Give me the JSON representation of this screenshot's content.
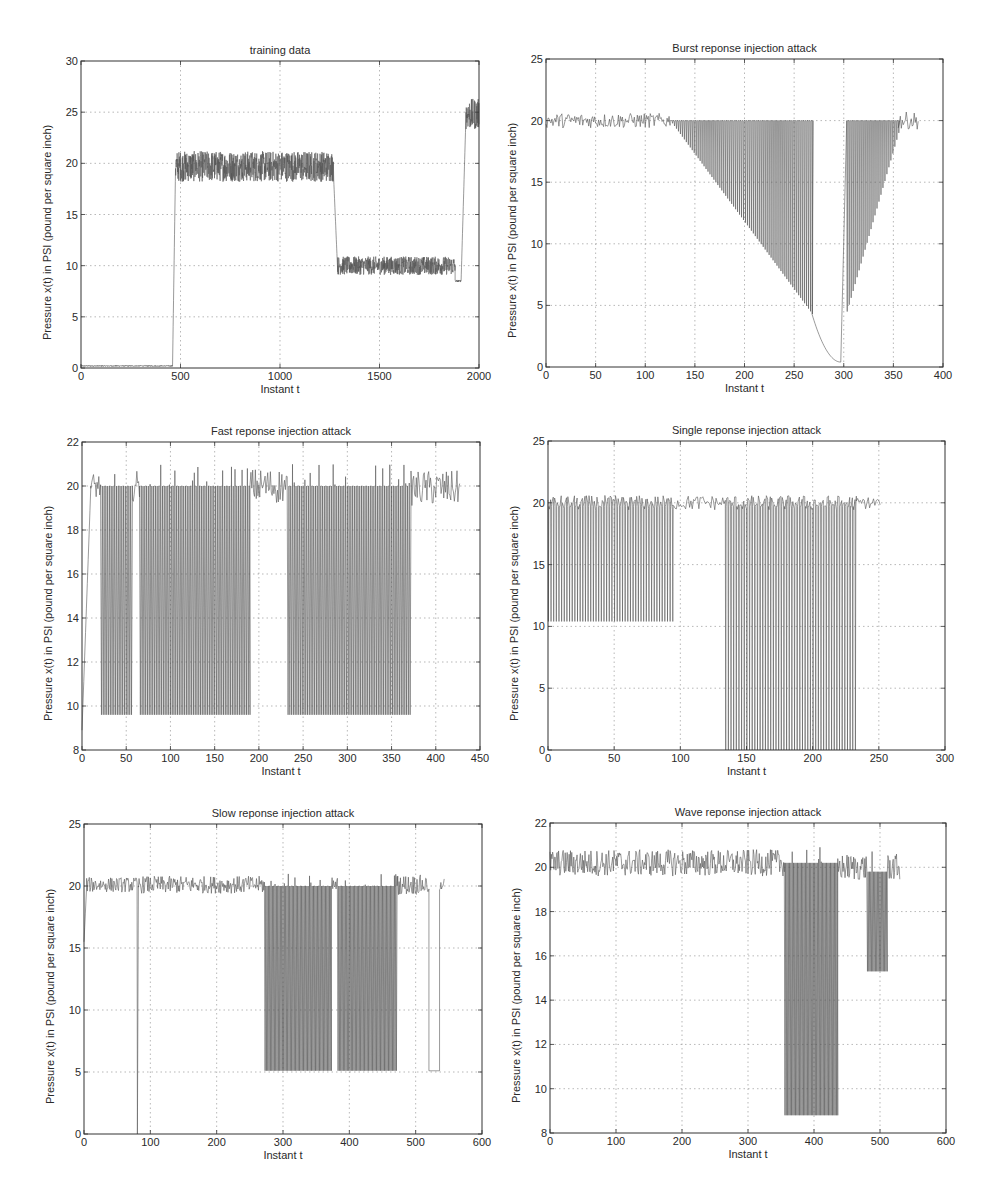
{
  "chart_data": [
    {
      "id": "p1",
      "type": "line",
      "title": "training data",
      "xlabel": "Instant t",
      "ylabel": "Pressure x(t) in PSI (pound per square inch)",
      "xlim": [
        0,
        2000
      ],
      "ylim": [
        0,
        30
      ],
      "xticks": [
        0,
        500,
        1000,
        1500,
        2000
      ],
      "yticks": [
        0,
        5,
        10,
        15,
        20,
        25,
        30
      ],
      "grid": true,
      "segments": [
        {
          "x": [
            0,
            460
          ],
          "level": 0.2,
          "noise": 0.05
        },
        {
          "x": [
            460,
            475
          ],
          "ramp_to": 19.5
        },
        {
          "x": [
            475,
            1270
          ],
          "level": 19.7,
          "noise": 1.5
        },
        {
          "x": [
            1270,
            1290
          ],
          "ramp_to": 9.4
        },
        {
          "x": [
            1290,
            1880
          ],
          "level": 10.0,
          "noise": 0.9
        },
        {
          "x": [
            1880,
            1910
          ],
          "level": 8.5,
          "noise": 0.1
        },
        {
          "x": [
            1910,
            1935
          ],
          "ramp_to": 25
        },
        {
          "x": [
            1935,
            2000
          ],
          "level": 24.8,
          "noise": 1.5
        }
      ]
    },
    {
      "id": "p2",
      "type": "line",
      "title": "Burst reponse injection attack",
      "xlabel": "Instant t",
      "ylabel": "Pressure x(t) in PSI (pound per square inch)",
      "xlim": [
        0,
        400
      ],
      "ylim": [
        0,
        25
      ],
      "xticks": [
        0,
        50,
        100,
        150,
        200,
        250,
        300,
        350,
        400
      ],
      "yticks": [
        0,
        5,
        10,
        15,
        20,
        25
      ],
      "grid": true,
      "segments": [
        {
          "x": [
            0,
            125
          ],
          "level": 20,
          "noise": 0.6
        },
        {
          "x": [
            125,
            268
          ],
          "attack": "burst-down",
          "high": 20,
          "low_start": 20,
          "low_end": 4.3
        },
        {
          "x": [
            268,
            297
          ],
          "curve": "decay",
          "from": 4.3,
          "to": 0.4
        },
        {
          "x": [
            297,
            303
          ],
          "ramp_to": 20
        },
        {
          "x": [
            303,
            355
          ],
          "attack": "burst-up",
          "high": 20,
          "low_start": 4.5,
          "low_end": 19
        },
        {
          "x": [
            355,
            375
          ],
          "level": 20,
          "noise": 0.7
        }
      ]
    },
    {
      "id": "p3",
      "type": "line",
      "title": "Fast reponse injection attack",
      "xlabel": "Instant t",
      "ylabel": "Pressure x(t) in PSI (pound per square inch)",
      "xlim": [
        0,
        450
      ],
      "ylim": [
        8,
        22
      ],
      "xticks": [
        0,
        50,
        100,
        150,
        200,
        250,
        300,
        350,
        400,
        450
      ],
      "yticks": [
        8,
        10,
        12,
        14,
        16,
        18,
        20,
        22
      ],
      "grid": true,
      "segments": [
        {
          "x": [
            0,
            10
          ],
          "ramp_from": 8.9,
          "ramp_to": 20
        },
        {
          "x": [
            10,
            21
          ],
          "level": 20,
          "noise": 0.6
        },
        {
          "x": [
            21,
            57
          ],
          "attack": "square",
          "high": 20,
          "low": 9.6
        },
        {
          "x": [
            57,
            65
          ],
          "level": 20,
          "noise": 0.7
        },
        {
          "x": [
            65,
            190
          ],
          "attack": "square",
          "high": 20,
          "low": 9.6
        },
        {
          "x": [
            190,
            232
          ],
          "level": 20,
          "noise": 0.8
        },
        {
          "x": [
            232,
            372
          ],
          "attack": "square",
          "high": 20,
          "low": 9.6
        },
        {
          "x": [
            372,
            427
          ],
          "level": 19.9,
          "noise": 0.8
        }
      ]
    },
    {
      "id": "p4",
      "type": "line",
      "title": "Single reponse injection attack",
      "xlabel": "Instant t",
      "ylabel": "Pressure x(t) in PSI (pound per square inch)",
      "xlim": [
        0,
        300
      ],
      "ylim": [
        0,
        25
      ],
      "xticks": [
        0,
        50,
        100,
        150,
        200,
        250,
        300
      ],
      "yticks": [
        0,
        5,
        10,
        15,
        20,
        25
      ],
      "grid": true,
      "segments": [
        {
          "x": [
            0,
            94
          ],
          "attack": "single",
          "high": 20,
          "low": 10.4
        },
        {
          "x": [
            94,
            134
          ],
          "level": 20,
          "noise": 0.6
        },
        {
          "x": [
            134,
            233
          ],
          "attack": "single",
          "high": 20,
          "low": 0
        },
        {
          "x": [
            233,
            251
          ],
          "level": 20,
          "noise": 0.5
        }
      ]
    },
    {
      "id": "p5",
      "type": "line",
      "title": "Slow reponse injection attack",
      "xlabel": "Instant t",
      "ylabel": "Pressure x(t) in PSI (pound per square inch)",
      "xlim": [
        0,
        600
      ],
      "ylim": [
        0,
        25
      ],
      "xticks": [
        0,
        100,
        200,
        300,
        400,
        500,
        600
      ],
      "yticks": [
        0,
        5,
        10,
        15,
        20,
        25
      ],
      "grid": true,
      "segments": [
        {
          "x": [
            0,
            4
          ],
          "ramp_from": 15.5,
          "ramp_to": 20
        },
        {
          "x": [
            4,
            80
          ],
          "level": 20.1,
          "noise": 0.6
        },
        {
          "x": [
            80,
            82
          ],
          "spike_to": 0
        },
        {
          "x": [
            82,
            272
          ],
          "level": 20.1,
          "noise": 0.7
        },
        {
          "x": [
            272,
            373
          ],
          "attack": "square",
          "high": 20,
          "low": 5.1
        },
        {
          "x": [
            373,
            382
          ],
          "level": 20,
          "noise": 0.7
        },
        {
          "x": [
            382,
            472
          ],
          "attack": "square",
          "high": 20,
          "low": 5.1
        },
        {
          "x": [
            472,
            520
          ],
          "level": 20.1,
          "noise": 0.8
        },
        {
          "x": [
            520,
            536
          ],
          "level": 5.1,
          "noise": 0
        },
        {
          "x": [
            536,
            543
          ],
          "level": 20.2,
          "noise": 0.6
        }
      ]
    },
    {
      "id": "p6",
      "type": "line",
      "title": "Wave reponse injection attack",
      "xlabel": "Instant t",
      "ylabel": "Pressure x(t) in PSI (pound per square inch)",
      "xlim": [
        0,
        600
      ],
      "ylim": [
        8,
        22
      ],
      "xticks": [
        0,
        100,
        200,
        300,
        400,
        500,
        600
      ],
      "yticks": [
        8,
        10,
        12,
        14,
        16,
        18,
        20,
        22
      ],
      "grid": true,
      "segments": [
        {
          "x": [
            0,
            355
          ],
          "level": 20.2,
          "noise": 0.6
        },
        {
          "x": [
            355,
            436
          ],
          "attack": "square",
          "high": 20.2,
          "low": 8.8
        },
        {
          "x": [
            436,
            480
          ],
          "level": 20,
          "noise": 0.6
        },
        {
          "x": [
            480,
            511
          ],
          "attack": "square",
          "high": 19.8,
          "low": 15.3
        },
        {
          "x": [
            511,
            530
          ],
          "level": 20,
          "noise": 0.6
        }
      ]
    }
  ],
  "layout": {
    "panels": [
      {
        "left": 81,
        "top": 61,
        "width": 398,
        "height": 307
      },
      {
        "left": 546,
        "top": 59,
        "width": 397,
        "height": 308
      },
      {
        "left": 82,
        "top": 442,
        "width": 398,
        "height": 308
      },
      {
        "left": 548,
        "top": 441,
        "width": 397,
        "height": 309
      },
      {
        "left": 84,
        "top": 824,
        "width": 398,
        "height": 310
      },
      {
        "left": 550,
        "top": 823,
        "width": 396,
        "height": 310
      }
    ]
  },
  "colors": {
    "line": "#555555",
    "axis": "#333333",
    "grid": "#9a9a9a",
    "background": "#ffffff"
  }
}
